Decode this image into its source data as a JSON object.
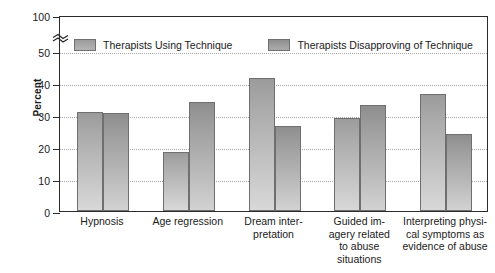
{
  "chart_data": {
    "type": "bar",
    "title": "",
    "xlabel": "",
    "ylabel": "Percent",
    "ylim": [
      0,
      50
    ],
    "grid": true,
    "axis_break": "between 50 and 100",
    "legend_position": "top-inside",
    "categories": [
      "Hypnosis",
      "Age regression",
      "Dream inter-\npretation",
      "Guided im-\nagery related\nto abuse\nsituations",
      "Interpreting physi-\ncal symptoms as\nevidence of abuse"
    ],
    "ytick_labels": [
      "0",
      "10",
      "20",
      "30",
      "40",
      "50",
      "100"
    ],
    "ytick_values": [
      0,
      10,
      20,
      30,
      40,
      50,
      100
    ],
    "series": [
      {
        "name": "Therapists Using Technique",
        "color": "#a8a8a8",
        "values": [
          31,
          18.5,
          41.5,
          29,
          36.5
        ]
      },
      {
        "name": "Therapists Disapproving of Technique",
        "color": "#9c9c9c",
        "values": [
          30.5,
          34,
          26.5,
          33,
          24
        ]
      }
    ]
  },
  "axis": {
    "y_title": "Percent",
    "ticks": [
      {
        "label": "0",
        "value": 0
      },
      {
        "label": "10",
        "value": 10
      },
      {
        "label": "20",
        "value": 20
      },
      {
        "label": "30",
        "value": 30
      },
      {
        "label": "40",
        "value": 40
      },
      {
        "label": "50",
        "value": 50
      },
      {
        "label": "100",
        "value": 100
      }
    ]
  },
  "legend": {
    "items": [
      {
        "label": "Therapists Using Technique"
      },
      {
        "label": "Therapists Disapproving of Technique"
      }
    ]
  },
  "categories": [
    {
      "lines": [
        "Hypnosis"
      ]
    },
    {
      "lines": [
        "Age regression"
      ]
    },
    {
      "lines": [
        "Dream inter-",
        "pretation"
      ]
    },
    {
      "lines": [
        "Guided im-",
        "agery related",
        "to abuse",
        "situations"
      ]
    },
    {
      "lines": [
        "Interpreting physi-",
        "cal symptoms as",
        "evidence of abuse"
      ]
    }
  ]
}
